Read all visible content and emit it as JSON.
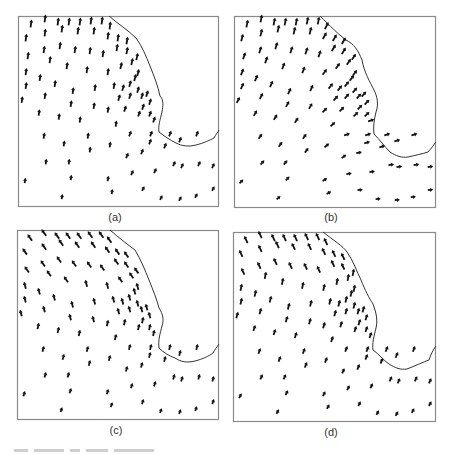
{
  "figure": {
    "panels": [
      {
        "id": "a",
        "label": "(a)",
        "frame": {
          "x": 18,
          "y": 16,
          "w": 201,
          "h": 191
        },
        "label_pos": {
          "x": 95,
          "y": 211
        },
        "coast": "M91,0 C100,8 110,14 118,22 C124,30 128,40 132,50 C136,60 140,70 142,80 C146,84 145,90 144,96 C142,104 140,110 141,116 C146,120 152,124 158,127 C164,130 170,131 178,129 C186,127 192,124 196,122 C198,118 200,116 201,114",
        "arrows_long": "13,8 27,3 40,6 51,6 62,6 73,5 84,5 92,10 8,22 27,17 44,13 60,15 76,15 90,20 100,22 109,25 10,40 26,34 42,30 57,34 72,35 85,38 99,32 109,35 8,56 32,44 49,50 69,54 90,56 103,50 114,46 119,41 8,70 22,62 37,68 55,75 77,72 96,70 105,72 112,68 117,62 120,57 4,84 27,80 53,88 76,90 101,82 112,80 120,74 124,80 129,78 1,104 21,97 41,101 62,104 90,94 107,93 121,98 125,91 132,86 26,120 46,128 70,120 98,108 112,118 133,118 136,104 132,98 28,146 51,146 72,134 92,129 109,140 124,136 132,126 147,130 152,118 162,124 179,118 201,114 7,165 53,162 90,163 114,157 137,155 156,148 164,150 181,148 195,150 44,181 94,176 125,173 143,182 162,183 178,180 195,173 78,198 106,194 137,195 145,200",
        "mode": "north"
      },
      {
        "id": "b",
        "label": "(b)",
        "frame": {
          "x": 234,
          "y": 16,
          "w": 202,
          "h": 192
        },
        "label_pos": {
          "x": 311,
          "y": 211
        },
        "coast": "M86,0 C96,10 104,18 112,24 C120,28 124,34 128,44 C130,56 136,66 140,74 C143,80 145,88 142,96 C140,104 139,112 140,118 C146,124 150,130 156,136 C162,140 168,142 174,141 C182,139 188,138 194,136 C198,132 200,128 202,126",
        "mode": "turning"
      },
      {
        "id": "c",
        "label": "(c)",
        "frame": {
          "x": 17,
          "y": 230,
          "w": 202,
          "h": 190
        },
        "label_pos": {
          "x": 96,
          "y": 424
        },
        "coast": "M93,0 C102,8 110,14 118,20 C124,30 128,40 132,50 C136,60 140,70 142,78 C146,84 147,90 145,96 C143,104 141,110 142,118 C146,122 152,126 158,128 C164,132 170,133 178,131 C186,129 192,126 196,123 C198,119 200,117 202,114",
        "mode": "nw"
      },
      {
        "id": "d",
        "label": "(d)",
        "frame": {
          "x": 233,
          "y": 232,
          "w": 203,
          "h": 190
        },
        "label_pos": {
          "x": 311,
          "y": 426
        },
        "coast": "M90,0 C100,8 110,14 114,20 C120,28 124,40 128,48 C132,58 136,66 140,72 C143,80 145,88 143,96 C141,104 139,112 140,118 C146,122 150,128 156,132 C162,136 168,138 174,137 C182,134 190,130 196,128 C198,122 200,118 203,114",
        "mode": "mixed"
      }
    ],
    "caption_visible": "partially cropped (illegible)"
  },
  "chart_data": [
    {
      "type": "vector-field",
      "title": "(a)",
      "xlabel": "",
      "ylabel": "",
      "note": "predominantly northward vectors, coastline upper right"
    },
    {
      "type": "vector-field",
      "title": "(b)",
      "xlabel": "",
      "ylabel": "",
      "note": "northward in west, turning eastward near coast bottom right"
    },
    {
      "type": "vector-field",
      "title": "(c)",
      "xlabel": "",
      "ylabel": "",
      "note": "north-westward vectors in northwest, northward elsewhere"
    },
    {
      "type": "vector-field",
      "title": "(d)",
      "xlabel": "",
      "ylabel": "",
      "note": "mixed north / north-westward vectors"
    }
  ],
  "colors": {
    "ink": "#111111",
    "frame": "#8a8a8a",
    "coast": "#333333",
    "label": "#333333"
  }
}
